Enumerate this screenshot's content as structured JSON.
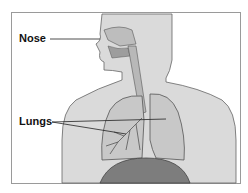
{
  "labels": {
    "nose": "Nose",
    "lungs": "Lungs"
  },
  "colors": {
    "body": "#d9d9d9",
    "outline": "#555555",
    "lung": "#c4c4c4",
    "diaphragm": "#7a7a7a"
  }
}
